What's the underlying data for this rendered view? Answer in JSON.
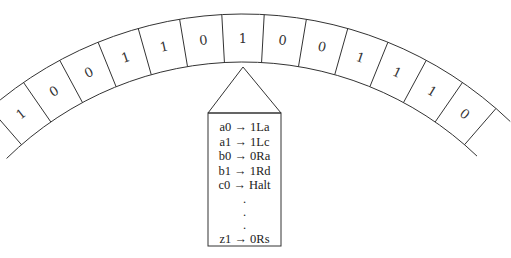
{
  "tape": {
    "cells": [
      "1",
      "0",
      "0",
      "1",
      "1",
      "0",
      "1",
      "0",
      "0",
      "1",
      "1",
      "1",
      "0"
    ],
    "head_index": 6
  },
  "head": {
    "rules": [
      "a0 → 1La",
      "a1 → 1Lc",
      "b0 → 0Ra",
      "b1 → 1Rd",
      "c0 → Halt"
    ],
    "ellipsis": [
      ".",
      ".",
      "."
    ],
    "last_rule": "z1 → 0Rs"
  },
  "colors": {
    "stroke": "#333333",
    "background": "#ffffff"
  }
}
